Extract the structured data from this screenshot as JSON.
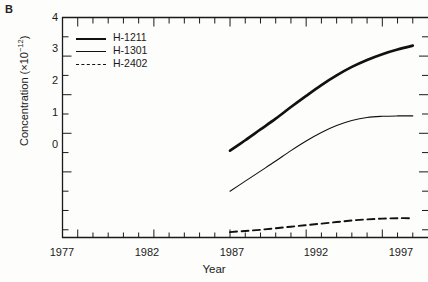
{
  "panel": {
    "label": "B"
  },
  "axes": {
    "xlabel": "Year",
    "ylabel_text": "Concentration (×10",
    "ylabel_sup": "−12",
    "ylabel_tail": ")",
    "ylabel_full": "Concentration (×10⁻¹²)",
    "x_tick_labels": [
      "1977",
      "1982",
      "1987",
      "1992",
      "1997"
    ],
    "y_tick_labels": [
      "4",
      "3",
      "2",
      "1",
      "0"
    ]
  },
  "legend": {
    "position": "inside-top-left",
    "entries": [
      {
        "label": "H-1211",
        "style": "thick-solid"
      },
      {
        "label": "H-1301",
        "style": "thin-solid"
      },
      {
        "label": "H-2402",
        "style": "dashed"
      }
    ]
  },
  "chart_data": {
    "type": "line",
    "title": "",
    "subtitle": "",
    "xlabel": "Year",
    "ylabel": "Concentration (×10⁻¹²)",
    "xlim": [
      1976,
      2000
    ],
    "ylim": [
      -1.7,
      4
    ],
    "xticks": [
      1977,
      1978,
      1979,
      1980,
      1981,
      1982,
      1983,
      1984,
      1985,
      1986,
      1987,
      1988,
      1989,
      1990,
      1991,
      1992,
      1993,
      1994,
      1995,
      1996,
      1997,
      1998,
      1999
    ],
    "xtick_labeled": [
      1977,
      1982,
      1987,
      1992,
      1997
    ],
    "yticks": [
      -1.5,
      -1,
      -0.5,
      0,
      0.5,
      1,
      1.5,
      2,
      2.5,
      3,
      3.5,
      4
    ],
    "ytick_labeled": [
      0,
      1,
      2,
      3,
      4
    ],
    "grid": false,
    "legend_position": "upper left",
    "series": [
      {
        "name": "H-1211",
        "style": "thick-solid",
        "color": "#111111",
        "x": [
          1987,
          1988,
          1989,
          1990,
          1991,
          1992,
          1993,
          1994,
          1995,
          1996,
          1997,
          1998,
          1999
        ],
        "values": [
          0.55,
          0.82,
          1.1,
          1.38,
          1.68,
          1.97,
          2.25,
          2.5,
          2.72,
          2.9,
          3.05,
          3.17,
          3.27
        ]
      },
      {
        "name": "H-1301",
        "style": "thin-solid",
        "color": "#111111",
        "x": [
          1987,
          1988,
          1989,
          1990,
          1991,
          1992,
          1993,
          1994,
          1995,
          1996,
          1997,
          1998,
          1999
        ],
        "values": [
          -0.5,
          -0.24,
          0.02,
          0.28,
          0.55,
          0.8,
          1.02,
          1.2,
          1.33,
          1.41,
          1.44,
          1.45,
          1.45
        ]
      },
      {
        "name": "H-2402",
        "style": "dashed",
        "color": "#111111",
        "x": [
          1987,
          1988,
          1989,
          1990,
          1991,
          1992,
          1993,
          1994,
          1995,
          1996,
          1997,
          1998,
          1999
        ],
        "values": [
          -1.56,
          -1.53,
          -1.5,
          -1.46,
          -1.42,
          -1.38,
          -1.34,
          -1.3,
          -1.26,
          -1.23,
          -1.21,
          -1.2,
          -1.2
        ]
      }
    ]
  }
}
